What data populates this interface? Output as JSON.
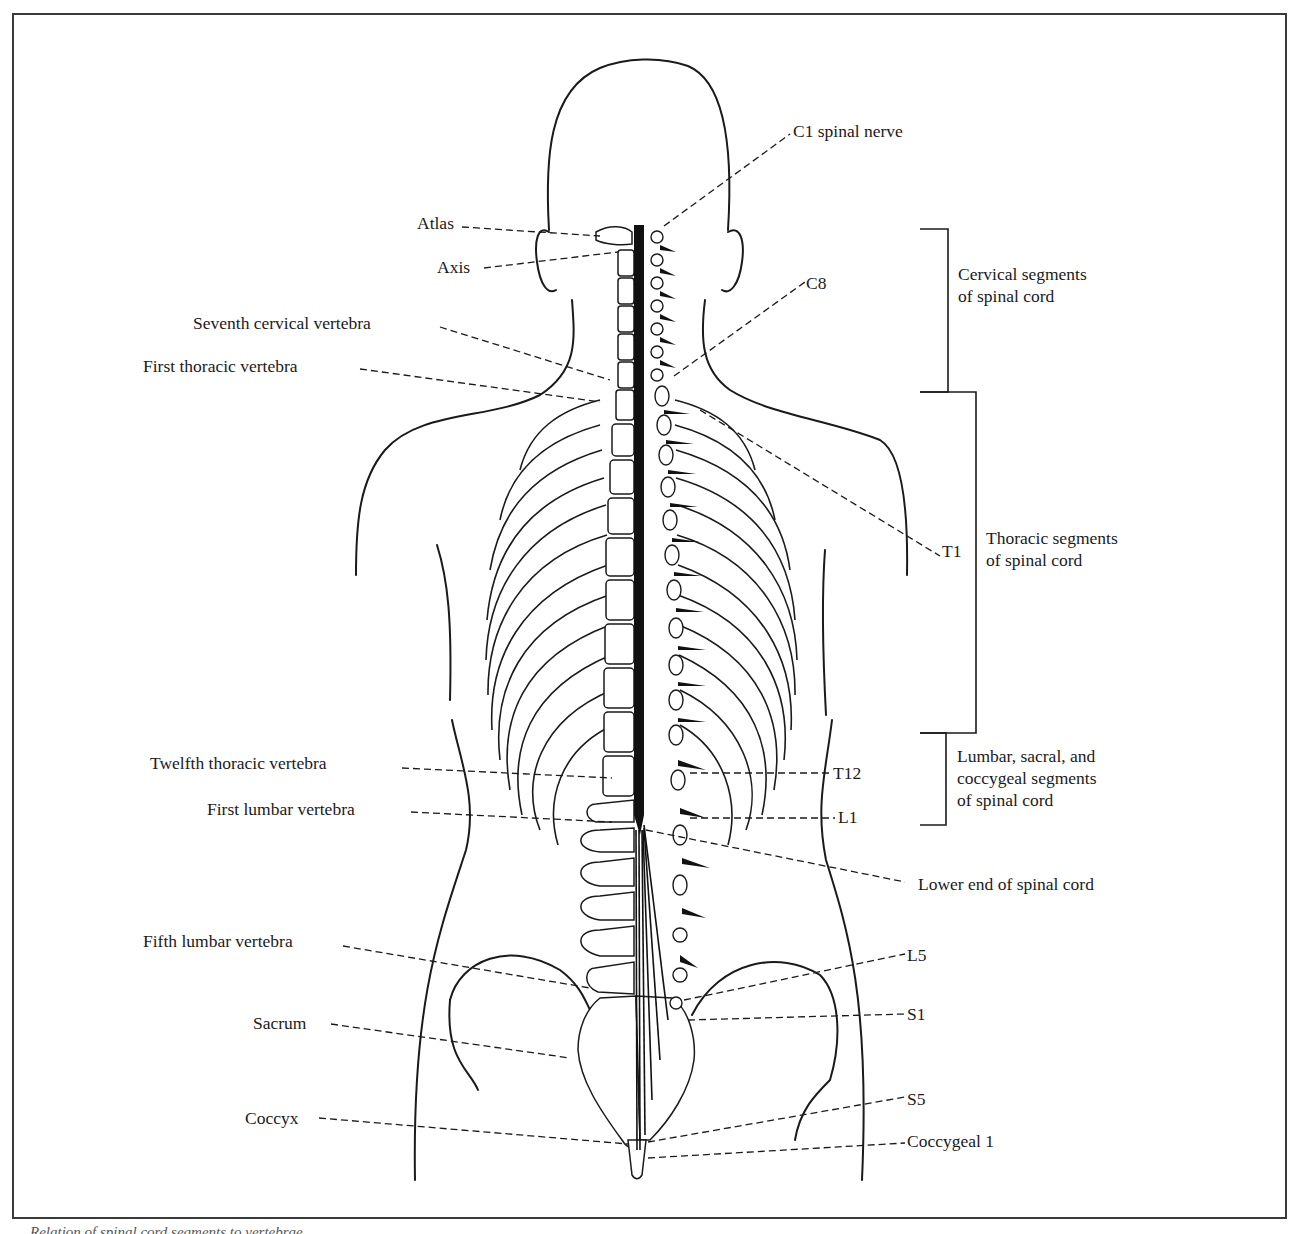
{
  "figure": {
    "left_labels": {
      "atlas": "Atlas",
      "axis": "Axis",
      "seventh_cervical": "Seventh cervical vertebra",
      "first_thoracic": "First thoracic vertebra",
      "twelfth_thoracic": "Twelfth thoracic vertebra",
      "first_lumbar": "First lumbar vertebra",
      "fifth_lumbar": "Fifth lumbar vertebra",
      "sacrum": "Sacrum",
      "coccyx": "Coccyx"
    },
    "right_labels": {
      "c1": "C1 spinal nerve",
      "c8": "C8",
      "t1": "T1",
      "t12": "T12",
      "l1": "L1",
      "lower_end": "Lower end of spinal cord",
      "l5": "L5",
      "s1": "S1",
      "s5": "S5",
      "coccygeal1": "Coccygeal 1"
    },
    "brackets": {
      "cervical_line1": "Cervical segments",
      "cervical_line2": "of spinal cord",
      "thoracic_line1": "Thoracic segments",
      "thoracic_line2": "of spinal cord",
      "lumbar_line1": "Lumbar, sacral, and",
      "lumbar_line2": "coccygeal segments",
      "lumbar_line3": "of spinal cord"
    },
    "caption": "Relation of spinal cord segments to vertebrae"
  },
  "colors": {
    "ink": "#1a1a1a",
    "frame": "#3a3a3a",
    "background": "#ffffff"
  }
}
